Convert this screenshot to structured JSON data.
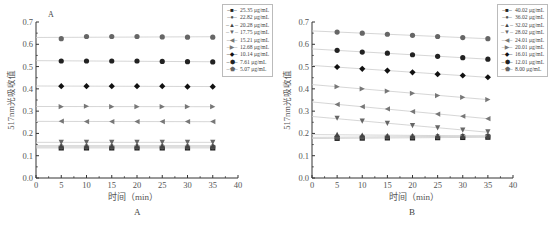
{
  "figure": {
    "panel_a_caption": "A",
    "panel_b_caption": "B",
    "panel_a_inset_label": "A"
  },
  "chart_data": [
    {
      "type": "scatter",
      "title": "A",
      "xlabel": "时间（min）",
      "ylabel": "517nm光吸收值",
      "xlim": [
        0,
        40
      ],
      "ylim": [
        0.0,
        0.7
      ],
      "xticks": [
        0,
        5,
        10,
        15,
        20,
        25,
        30,
        35,
        40
      ],
      "yticks": [
        0.0,
        0.1,
        0.2,
        0.3,
        0.4,
        0.5,
        0.6,
        0.7
      ],
      "grid": false,
      "legend_position": "top-right",
      "x": [
        5,
        10,
        15,
        20,
        25,
        30,
        35
      ],
      "series": [
        {
          "name": "25.35 μg/mL",
          "marker": "square",
          "values": [
            0.135,
            0.135,
            0.135,
            0.135,
            0.135,
            0.135,
            0.135
          ]
        },
        {
          "name": "22.82 μg/mL",
          "marker": "circle",
          "values": [
            0.14,
            0.14,
            0.14,
            0.14,
            0.14,
            0.14,
            0.14
          ]
        },
        {
          "name": "20.28 μg/mL",
          "marker": "triangle-up",
          "values": [
            0.145,
            0.145,
            0.145,
            0.145,
            0.145,
            0.145,
            0.145
          ]
        },
        {
          "name": "17.75 μg/mL",
          "marker": "triangle-down",
          "values": [
            0.16,
            0.16,
            0.16,
            0.16,
            0.16,
            0.16,
            0.16
          ]
        },
        {
          "name": "15.21 μg/mL",
          "marker": "triangle-left",
          "values": [
            0.255,
            0.253,
            0.253,
            0.253,
            0.253,
            0.253,
            0.253
          ]
        },
        {
          "name": "12.68 μg/mL",
          "marker": "triangle-right",
          "values": [
            0.32,
            0.322,
            0.32,
            0.32,
            0.32,
            0.32,
            0.32
          ]
        },
        {
          "name": "10.14 μg/mL",
          "marker": "diamond",
          "values": [
            0.412,
            0.412,
            0.412,
            0.412,
            0.412,
            0.41,
            0.41
          ]
        },
        {
          "name": "7.61 μg/mL",
          "marker": "hexagon",
          "values": [
            0.525,
            0.525,
            0.525,
            0.525,
            0.523,
            0.522,
            0.521
          ]
        },
        {
          "name": "5.07 μg/mL",
          "marker": "pentagon",
          "values": [
            0.625,
            0.635,
            0.635,
            0.635,
            0.633,
            0.632,
            0.632
          ]
        }
      ]
    },
    {
      "type": "scatter",
      "title": "B",
      "xlabel": "时间（min）",
      "ylabel": "517nm光吸收值",
      "xlim": [
        0,
        40
      ],
      "ylim": [
        0.0,
        0.7
      ],
      "xticks": [
        0,
        5,
        10,
        15,
        20,
        25,
        30,
        35,
        40
      ],
      "yticks": [
        0.0,
        0.1,
        0.2,
        0.3,
        0.4,
        0.5,
        0.6,
        0.7
      ],
      "grid": false,
      "legend_position": "top-right",
      "x": [
        5,
        10,
        15,
        20,
        25,
        30,
        35
      ],
      "series": [
        {
          "name": "40.02 μg/mL",
          "marker": "square",
          "values": [
            0.178,
            0.179,
            0.18,
            0.18,
            0.181,
            0.182,
            0.183
          ]
        },
        {
          "name": "36.02 μg/mL",
          "marker": "circle",
          "values": [
            0.183,
            0.184,
            0.185,
            0.185,
            0.186,
            0.187,
            0.188
          ]
        },
        {
          "name": "32.02 μg/mL",
          "marker": "triangle-up",
          "values": [
            0.196,
            0.193,
            0.19,
            0.19,
            0.19,
            0.19,
            0.19
          ]
        },
        {
          "name": "28.02 μg/mL",
          "marker": "triangle-down",
          "values": [
            0.268,
            0.255,
            0.245,
            0.235,
            0.225,
            0.215,
            0.207
          ]
        },
        {
          "name": "24.01 μg/mL",
          "marker": "triangle-left",
          "values": [
            0.33,
            0.32,
            0.31,
            0.298,
            0.287,
            0.277,
            0.266
          ]
        },
        {
          "name": "20.01 μg/mL",
          "marker": "triangle-right",
          "values": [
            0.41,
            0.4,
            0.39,
            0.38,
            0.37,
            0.362,
            0.352
          ]
        },
        {
          "name": "16.01 μg/mL",
          "marker": "diamond",
          "values": [
            0.498,
            0.49,
            0.482,
            0.474,
            0.466,
            0.46,
            0.452
          ]
        },
        {
          "name": "12.01 μg/mL",
          "marker": "hexagon",
          "values": [
            0.573,
            0.565,
            0.56,
            0.553,
            0.546,
            0.54,
            0.533
          ]
        },
        {
          "name": "8.00 μg/mL",
          "marker": "pentagon",
          "values": [
            0.655,
            0.65,
            0.645,
            0.64,
            0.635,
            0.63,
            0.625
          ]
        }
      ]
    }
  ],
  "colors": {
    "axis": "#333333",
    "marker_dark": "#222222",
    "marker_mid": "#555555",
    "marker_light": "#777777",
    "line": "#cccccc"
  }
}
